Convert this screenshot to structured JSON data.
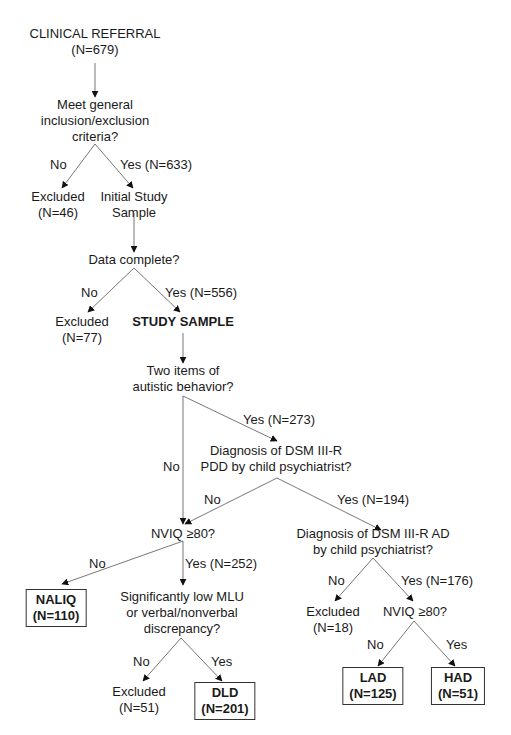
{
  "diagram": {
    "type": "flowchart",
    "nodes": {
      "referral": {
        "lines": [
          "CLINICAL REFERRAL",
          "(N=679)"
        ]
      },
      "criteria": {
        "lines": [
          "Meet general",
          "inclusion/exclusion",
          "criteria?"
        ]
      },
      "excluded1": {
        "lines": [
          "Excluded",
          "(N=46)"
        ]
      },
      "initial": {
        "lines": [
          "Initial Study",
          "Sample"
        ]
      },
      "data_complete": {
        "lines": [
          "Data complete?"
        ]
      },
      "excluded2": {
        "lines": [
          "Excluded",
          "(N=77)"
        ]
      },
      "study_sample": {
        "lines": [
          "STUDY SAMPLE"
        ]
      },
      "two_items": {
        "lines": [
          "Two items of",
          "autistic behavior?"
        ]
      },
      "pdd": {
        "lines": [
          "Diagnosis of DSM III-R",
          "PDD by child psychiatrist?"
        ]
      },
      "nviq1": {
        "lines": [
          "NVIQ ≥80?"
        ]
      },
      "ad": {
        "lines": [
          "Diagnosis of DSM III-R AD",
          "by child psychiatrist?"
        ]
      },
      "naliq": {
        "lines": [
          "NALIQ",
          "(N=110)"
        ]
      },
      "mlu": {
        "lines": [
          "Significantly low MLU",
          "or verbal/nonverbal",
          "discrepancy?"
        ]
      },
      "excluded3": {
        "lines": [
          "Excluded",
          "(N=18)"
        ]
      },
      "nviq2": {
        "lines": [
          "NVIQ ≥80?"
        ]
      },
      "excluded4": {
        "lines": [
          "Excluded",
          "(N=51)"
        ]
      },
      "dld": {
        "lines": [
          "DLD",
          "(N=201)"
        ]
      },
      "lad": {
        "lines": [
          "LAD",
          "(N=125)"
        ]
      },
      "had": {
        "lines": [
          "HAD",
          "(N=51)"
        ]
      }
    },
    "edge_labels": {
      "criteria_no": "No",
      "criteria_yes": "Yes (N=633)",
      "data_no": "No",
      "data_yes": "Yes (N=556)",
      "two_items_yes": "Yes (N=273)",
      "two_items_no": "No",
      "pdd_no": "No",
      "pdd_yes": "Yes (N=194)",
      "nviq1_no": "No",
      "nviq1_yes": "Yes (N=252)",
      "ad_no": "No",
      "ad_yes": "Yes (N=176)",
      "mlu_no": "No",
      "mlu_yes": "Yes",
      "nviq2_no": "No",
      "nviq2_yes": "Yes"
    }
  }
}
